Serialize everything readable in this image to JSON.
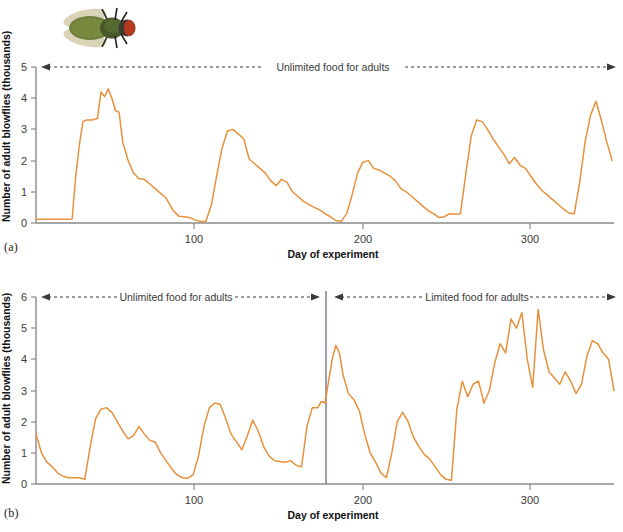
{
  "figure": {
    "line_color": "#e8913c",
    "axis_color": "#8a8a8a",
    "annotation_color": "#3a3a3a",
    "divider_color": "#6f7a86"
  },
  "fly_image": {
    "name": "blowfly-photo",
    "body_color": "#6c7a3a",
    "thorax_color": "#4a5a2a",
    "eye_color": "#b0331c",
    "wing_color": "#cfc9a8"
  },
  "panels": [
    {
      "id": "a",
      "label": "(a)",
      "ylabel": "Number of adult blowflies (thousands)",
      "xlabel": "Day of experiment",
      "yticks": [
        0,
        1,
        2,
        3,
        4,
        5
      ],
      "xticks": [
        100,
        200,
        300
      ],
      "annotations": [
        {
          "text": "Unlimited food for adults",
          "arrows": "both"
        }
      ],
      "chart_data": {
        "type": "line",
        "title": "Blowfly population with unlimited adult food",
        "xlabel": "Day of experiment",
        "ylabel": "Number of adult blowflies (thousands)",
        "xlim": [
          0,
          320
        ],
        "ylim": [
          0,
          5
        ],
        "grid": false,
        "legend": "none",
        "series": [
          {
            "name": "Adult blowflies (unlimited food)",
            "x": [
              0,
              5,
              10,
              15,
              18,
              20,
              22,
              24,
              26,
              28,
              31,
              34,
              36,
              38,
              40,
              42,
              44,
              46,
              48,
              51,
              54,
              57,
              60,
              63,
              66,
              69,
              72,
              74,
              76,
              79,
              82,
              85,
              88,
              91,
              94,
              97,
              100,
              103,
              106,
              109,
              112,
              115,
              118,
              121,
              124,
              127,
              130,
              133,
              136,
              139,
              142,
              145,
              148,
              151,
              154,
              157,
              160,
              163,
              166,
              169,
              172,
              175,
              178,
              181,
              184,
              187,
              190,
              193,
              196,
              199,
              202,
              205,
              208,
              211,
              214,
              217,
              220,
              223,
              226,
              229,
              232,
              235,
              238,
              241,
              244,
              247,
              250,
              253,
              256,
              259,
              262,
              265,
              268,
              271,
              274,
              277,
              280,
              283,
              286,
              289,
              292,
              295,
              298,
              301,
              304,
              307,
              310,
              313,
              316,
              319
            ],
            "y": [
              0.12,
              0.12,
              0.12,
              0.12,
              0.12,
              0.13,
              1.5,
              2.5,
              3.25,
              3.3,
              3.3,
              3.35,
              4.2,
              4.05,
              4.3,
              4.0,
              3.6,
              3.55,
              2.6,
              2.0,
              1.6,
              1.42,
              1.4,
              1.25,
              1.1,
              0.95,
              0.8,
              0.6,
              0.4,
              0.22,
              0.2,
              0.18,
              0.1,
              0.05,
              0.05,
              0.55,
              1.5,
              2.4,
              2.95,
              3.0,
              2.85,
              2.7,
              2.05,
              1.9,
              1.75,
              1.6,
              1.35,
              1.2,
              1.4,
              1.3,
              1.0,
              0.85,
              0.7,
              0.6,
              0.5,
              0.42,
              0.3,
              0.2,
              0.08,
              0.05,
              0.3,
              0.9,
              1.6,
              1.95,
              2.0,
              1.75,
              1.7,
              1.6,
              1.5,
              1.35,
              1.1,
              1.0,
              0.85,
              0.7,
              0.55,
              0.4,
              0.3,
              0.18,
              0.2,
              0.3,
              0.28,
              0.3,
              1.6,
              2.8,
              3.3,
              3.25,
              3.0,
              2.7,
              2.45,
              2.2,
              1.9,
              2.1,
              1.85,
              1.75,
              1.5,
              1.25,
              1.05,
              0.9,
              0.75,
              0.6,
              0.45,
              0.32,
              0.3,
              1.3,
              2.6,
              3.45,
              3.9,
              3.3,
              2.6,
              2.0
            ],
            "color": "#e8913c"
          }
        ]
      }
    },
    {
      "id": "b",
      "label": "(b)",
      "ylabel": "Number of adult blowflies (thousands)",
      "xlabel": "Day of experiment",
      "yticks": [
        0,
        1,
        2,
        3,
        4,
        5,
        6
      ],
      "xticks": [
        100,
        200,
        300
      ],
      "divider_day": 160,
      "annotations": [
        {
          "text": "Unlimited food for adults",
          "arrows": "both"
        },
        {
          "text": "Limited food for adults",
          "arrows": "both"
        }
      ],
      "chart_data": {
        "type": "line",
        "title": "Blowfly population: unlimited then limited adult food",
        "xlabel": "Day of experiment",
        "ylabel": "Number of adult blowflies (thousands)",
        "xlim": [
          0,
          320
        ],
        "ylim": [
          0,
          6
        ],
        "grid": false,
        "legend": "none",
        "series": [
          {
            "name": "Adult blowflies (food switch at day 160)",
            "x": [
              0,
              3,
              6,
              9,
              12,
              15,
              18,
              21,
              24,
              27,
              30,
              33,
              36,
              39,
              42,
              45,
              48,
              51,
              54,
              57,
              60,
              63,
              66,
              69,
              72,
              75,
              78,
              81,
              84,
              87,
              90,
              93,
              96,
              99,
              102,
              105,
              108,
              111,
              114,
              117,
              120,
              123,
              126,
              129,
              132,
              135,
              138,
              141,
              144,
              147,
              150,
              153,
              156,
              158,
              160,
              162,
              164,
              166,
              168,
              170,
              173,
              176,
              179,
              182,
              185,
              188,
              191,
              194,
              197,
              200,
              203,
              206,
              209,
              212,
              215,
              218,
              221,
              224,
              227,
              230,
              233,
              236,
              239,
              242,
              245,
              248,
              251,
              254,
              257,
              260,
              263,
              266,
              269,
              272,
              275,
              278,
              281,
              284,
              287,
              290,
              293,
              296,
              299,
              302,
              305,
              308,
              311,
              314,
              317,
              320
            ],
            "y": [
              1.6,
              1.0,
              0.7,
              0.55,
              0.35,
              0.25,
              0.2,
              0.2,
              0.2,
              0.15,
              1.2,
              2.1,
              2.4,
              2.45,
              2.3,
              2.0,
              1.7,
              1.45,
              1.55,
              1.85,
              1.6,
              1.4,
              1.35,
              1.0,
              0.75,
              0.5,
              0.3,
              0.2,
              0.18,
              0.3,
              0.9,
              1.85,
              2.45,
              2.6,
              2.55,
              2.1,
              1.6,
              1.35,
              1.1,
              1.55,
              2.05,
              1.7,
              1.2,
              0.9,
              0.75,
              0.72,
              0.7,
              0.75,
              0.6,
              0.55,
              1.85,
              2.45,
              2.45,
              2.65,
              2.6,
              3.3,
              4.0,
              4.45,
              4.2,
              3.5,
              2.9,
              2.7,
              2.35,
              1.6,
              1.0,
              0.7,
              0.35,
              0.2,
              1.0,
              2.0,
              2.3,
              2.0,
              1.5,
              1.2,
              0.95,
              0.8,
              0.55,
              0.3,
              0.15,
              0.12,
              2.4,
              3.3,
              2.8,
              3.2,
              3.3,
              2.6,
              3.0,
              3.9,
              4.5,
              4.2,
              5.3,
              5.0,
              5.5,
              4.0,
              3.1,
              5.6,
              4.3,
              3.6,
              3.4,
              3.2,
              3.6,
              3.3,
              2.9,
              3.2,
              4.1,
              4.6,
              4.5,
              4.2,
              4.0,
              3.0
            ]
          }
        ]
      }
    }
  ]
}
